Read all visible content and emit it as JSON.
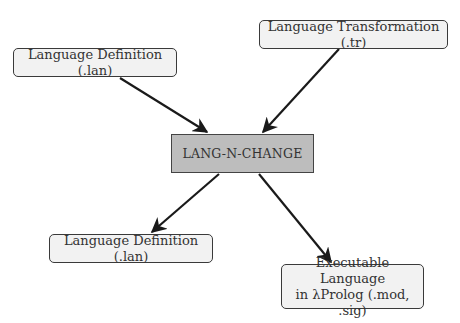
{
  "diagram": {
    "center": {
      "label": "LANG-N-CHANGE",
      "fill": "#bdbdbd"
    },
    "nodes": {
      "input_definition": {
        "label": "Language Definition (.lan)"
      },
      "input_transformation": {
        "label": "Language Transformation (.tr)"
      },
      "output_definition": {
        "label": "Language Definition (.lan)"
      },
      "output_executable": {
        "line1": "Executable Language",
        "line2": "in λProlog (.mod, .sig)"
      }
    },
    "edges": [
      {
        "from": "input_definition",
        "to": "center"
      },
      {
        "from": "input_transformation",
        "to": "center"
      },
      {
        "from": "center",
        "to": "output_definition"
      },
      {
        "from": "center",
        "to": "output_executable"
      }
    ]
  }
}
